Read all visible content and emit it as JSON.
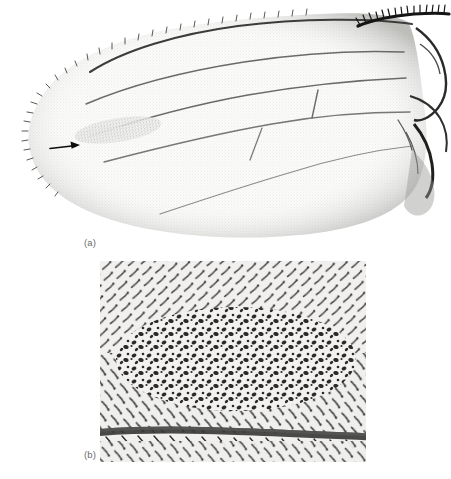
{
  "figure": {
    "background_color": "#ffffff",
    "ink_color": "#3a3a3a",
    "panels": [
      {
        "id": "a",
        "label": "(a)",
        "kind": "light-micrograph",
        "subject": "drosophila-wing-whole-mount",
        "annotation": "arrow",
        "annotation_meaning": "multiple-wing-hair-patch"
      },
      {
        "id": "b",
        "label": "(b)",
        "kind": "light-micrograph",
        "subject": "wing-trichome-field-high-magnification",
        "annotation": "none",
        "annotation_meaning": "cluster-of-multiple-hair-cells"
      }
    ]
  },
  "panel_a": {
    "label": "(a)",
    "background_color": "#ffffff",
    "membrane_color": "#f6f6f4",
    "vein_color": "#5a5a5a",
    "margin_color": "#2e2e2e",
    "arrow": {
      "color": "#111111",
      "x1": 50,
      "y1": 148,
      "x2": 80,
      "y2": 145
    },
    "hair_patch": {
      "note": "stippled darker trichome field distal to arrow"
    }
  },
  "panel_b": {
    "label": "(b)",
    "frame": {
      "left": 100,
      "top": 261,
      "width": 266,
      "height": 201
    },
    "background_color": "#f0efed",
    "hair_color": "#2b2b2b",
    "vein_color": "#4a4a4a",
    "cluster": {
      "note": "dense central field of dark multiple-hair cells"
    }
  },
  "bottom_bleed": {
    "text": ""
  }
}
